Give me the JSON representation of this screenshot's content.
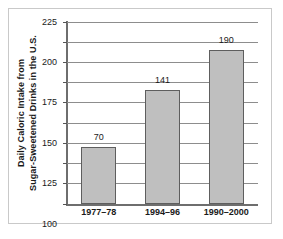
{
  "chart_data": {
    "type": "bar",
    "title": "",
    "subtitle": "",
    "xlabel": "",
    "ylabel_lines": [
      "Daily Caloric Intake from",
      "Sugar-Sweetened Drinks in the U.S."
    ],
    "ylabel": "Daily Caloric Intake from Sugar-Sweetened Drinks in the U.S.",
    "categories": [
      "1977–78",
      "1994–96",
      "1990–2000"
    ],
    "values": [
      70,
      141,
      190
    ],
    "value_labels": [
      "70",
      "141",
      "190"
    ],
    "ylim": [
      0,
      225
    ],
    "ytick_values": [
      0,
      25,
      50,
      75,
      100,
      125,
      150,
      175,
      200,
      225
    ],
    "ytick_labels": [
      "0",
      "25",
      "50",
      "75",
      "100",
      "125",
      "150",
      "175",
      "200",
      "225"
    ],
    "grid": true,
    "grid_axis": "y",
    "legend": "none",
    "bar_fill_color": "#bfbfbf",
    "bar_edge_color": "#5e5e5e",
    "gridline_color": "#8d8d8d",
    "axis_color": "#6e6e6e",
    "text_color": "#1a1a1a",
    "background_color": "#ffffff",
    "frame_color": "#c9c9c9"
  }
}
